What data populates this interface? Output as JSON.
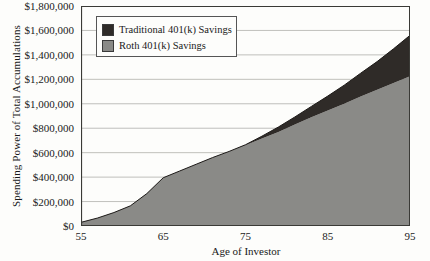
{
  "chart_data": {
    "type": "area",
    "stacked": true,
    "title": "",
    "xlabel": "Age of Investor",
    "ylabel": "Spending Power of Total Accumulations",
    "xlim": [
      55,
      95
    ],
    "ylim": [
      0,
      1800000
    ],
    "grid": true,
    "legend_position": "top-left",
    "x_ticks": [
      "55",
      "65",
      "75",
      "85",
      "95"
    ],
    "x_tick_values": [
      55,
      65,
      75,
      85,
      95
    ],
    "y_ticks": [
      "$0",
      "$200,000",
      "$400,000",
      "$600,000",
      "$800,000",
      "$1,000,000",
      "$1,200,000",
      "$1,400,000",
      "$1,600,000",
      "$1,800,000"
    ],
    "y_tick_values": [
      0,
      200000,
      400000,
      600000,
      800000,
      1000000,
      1200000,
      1400000,
      1600000,
      1800000
    ],
    "x": [
      55,
      57,
      59,
      61,
      63,
      65,
      67,
      69,
      71,
      73,
      75,
      77,
      79,
      81,
      83,
      85,
      87,
      89,
      91,
      93,
      95
    ],
    "series": [
      {
        "name": "Roth 401(k) Savings",
        "color": "#8a8a87",
        "values": [
          30000,
          65000,
          110000,
          165000,
          265000,
          395000,
          450000,
          505000,
          560000,
          610000,
          660000,
          715000,
          770000,
          830000,
          890000,
          945000,
          1000000,
          1060000,
          1115000,
          1170000,
          1225000
        ]
      },
      {
        "name": "Traditional 401(k) Savings",
        "color": "#2f2b28",
        "values": [
          0,
          0,
          0,
          0,
          0,
          0,
          0,
          0,
          0,
          0,
          5000,
          20000,
          40000,
          62000,
          88000,
          118000,
          152000,
          190000,
          230000,
          280000,
          335000
        ]
      }
    ]
  },
  "legend": {
    "items": [
      {
        "label": "Traditional 401(k) Savings",
        "color": "#2f2b28"
      },
      {
        "label": "Roth 401(k) Savings",
        "color": "#8a8a87"
      }
    ]
  },
  "axes": {
    "x_title": "Age of Investor",
    "y_title": "Spending Power of Total Accumulations"
  },
  "colors": {
    "traditional": "#2f2b28",
    "roth": "#8a8a87",
    "grid": "#b9b9b4",
    "axis": "#3a3a36",
    "background": "#fdfdfb"
  }
}
